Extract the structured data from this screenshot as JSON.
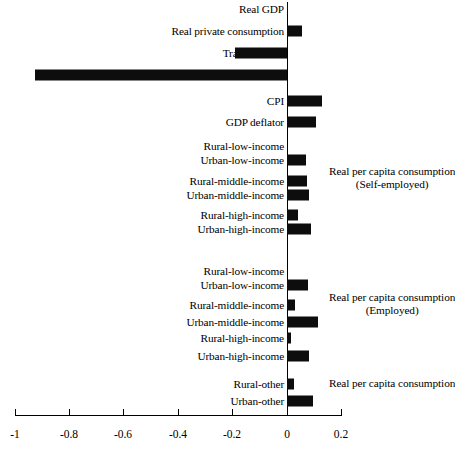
{
  "chart_data": {
    "type": "bar",
    "orientation": "horizontal",
    "title": "",
    "xlabel": "",
    "ylabel": "",
    "xlim": [
      -1,
      0.2
    ],
    "xticks": [
      -1,
      -0.8,
      -0.6,
      -0.4,
      -0.2,
      0,
      0.2
    ],
    "xtick_labels": [
      "-1",
      "-0.8",
      "-0.6",
      "-0.4",
      "-0.2",
      "0",
      "0.2"
    ],
    "grid": false,
    "legend": "none",
    "bar_color": "#0d0d0d",
    "categories": [
      "Real GDP",
      "Real private consumption",
      "Trade balance",
      "Indirect tax revenues",
      "CPI",
      "GDP deflator",
      "Rural-low-income",
      "Urban-low-income",
      "Rural-middle-income",
      "Urban-middle-income",
      "Rural-high-income",
      "Urban-high-income",
      "Rural-low-income",
      "Urban-low-income",
      "Rural-middle-income",
      "Urban-middle-income",
      "Rural-high-income",
      "Urban-high-income",
      "Rural-other",
      "Urban-other"
    ],
    "values": [
      0.004,
      0.057,
      -0.191,
      -0.934,
      0.13,
      0.107,
      0.0,
      0.07,
      0.075,
      0.08,
      0.04,
      0.09,
      0.0,
      0.077,
      0.03,
      0.115,
      0.015,
      0.08,
      0.025,
      0.095
    ],
    "annotations": [
      {
        "text": "Real per capita consumption",
        "sub": "(Self-employed)"
      },
      {
        "text": "Real per capita consumption",
        "sub": "(Employed)"
      },
      {
        "text": "Real per capita consumption",
        "sub": ""
      }
    ]
  },
  "rows": [
    {
      "label": "Real GDP",
      "value": 0.004,
      "y": 8
    },
    {
      "label": "Real private consumption",
      "value": 0.057,
      "y": 30
    },
    {
      "label": "Trade balance",
      "value": -0.191,
      "y": 52
    },
    {
      "label": "Indirect tax revenues",
      "value": -0.934,
      "y": 74
    },
    {
      "label": "CPI",
      "value": 0.13,
      "y": 100
    },
    {
      "label": "GDP deflator",
      "value": 0.107,
      "y": 121
    },
    {
      "label": "Rural-low-income",
      "value": 0.0,
      "y": 145
    },
    {
      "label": "Urban-low-income",
      "value": 0.07,
      "y": 159
    },
    {
      "label": "Rural-middle-income",
      "value": 0.075,
      "y": 180
    },
    {
      "label": "Urban-middle-income",
      "value": 0.08,
      "y": 194
    },
    {
      "label": "Rural-high-income",
      "value": 0.04,
      "y": 214
    },
    {
      "label": "Urban-high-income",
      "value": 0.09,
      "y": 228
    },
    {
      "label": "Rural-low-income",
      "value": 0.0,
      "y": 270
    },
    {
      "label": "Urban-low-income",
      "value": 0.077,
      "y": 284
    },
    {
      "label": "Rural-middle-income",
      "value": 0.03,
      "y": 304
    },
    {
      "label": "Urban-middle-income",
      "value": 0.115,
      "y": 321
    },
    {
      "label": "Rural-high-income",
      "value": 0.015,
      "y": 337
    },
    {
      "label": "Urban-high-income",
      "value": 0.08,
      "y": 355
    },
    {
      "label": "Rural-other",
      "value": 0.025,
      "y": 383
    },
    {
      "label": "Urban-other",
      "value": 0.095,
      "y": 400
    }
  ],
  "axis": {
    "ticks": [
      {
        "label": "-1",
        "x": 15
      },
      {
        "label": "-0.8",
        "x": 69
      },
      {
        "label": "-0.6",
        "x": 123
      },
      {
        "label": "-0.4",
        "x": 178
      },
      {
        "label": "-0.2",
        "x": 232
      },
      {
        "label": "0",
        "x": 287
      },
      {
        "label": "0.2",
        "x": 341
      }
    ],
    "y": 415
  },
  "annotations": [
    {
      "line1": "Real per capita consumption",
      "line2": "(Self-employed)",
      "x": 329,
      "y": 172
    },
    {
      "line1": "Real per capita consumption",
      "line2": "(Employed)",
      "x": 329,
      "y": 297
    },
    {
      "line1": "Real per capita consumption",
      "line2": "",
      "x": 329,
      "y": 382
    }
  ],
  "caption": {
    "text": ""
  }
}
